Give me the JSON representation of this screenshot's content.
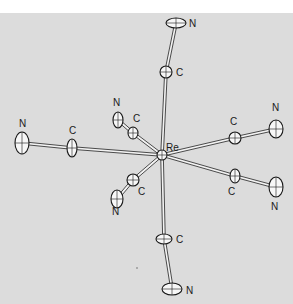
{
  "figure": {
    "background_color": "#dcdcdc",
    "top_band_color": "#ffffff",
    "center": {
      "label": "Re",
      "x": 162,
      "y": 155,
      "label_x": 166,
      "label_y": 151
    },
    "ligands": [
      {
        "name": "top",
        "c": {
          "x": 166,
          "y": 72,
          "rx": 6,
          "ry": 6,
          "label_x": 176,
          "label_y": 76
        },
        "n": {
          "x": 176,
          "y": 23,
          "rx": 10,
          "ry": 5,
          "label_x": 189,
          "label_y": 27
        }
      },
      {
        "name": "upper-left",
        "c": {
          "x": 133,
          "y": 133,
          "rx": 5,
          "ry": 6,
          "label_x": 133,
          "label_y": 122
        },
        "n": {
          "x": 118,
          "y": 120,
          "rx": 5,
          "ry": 8,
          "label_x": 113,
          "label_y": 106
        }
      },
      {
        "name": "left",
        "c": {
          "x": 72,
          "y": 148,
          "rx": 5,
          "ry": 9,
          "label_x": 69,
          "label_y": 134
        },
        "n": {
          "x": 22,
          "y": 143,
          "rx": 7,
          "ry": 11,
          "label_x": 19,
          "label_y": 127
        }
      },
      {
        "name": "right-upper",
        "c": {
          "x": 235,
          "y": 138,
          "rx": 6,
          "ry": 6,
          "label_x": 230,
          "label_y": 125
        },
        "n": {
          "x": 276,
          "y": 129,
          "rx": 7,
          "ry": 9,
          "label_x": 272,
          "label_y": 111
        }
      },
      {
        "name": "right-lower",
        "c": {
          "x": 235,
          "y": 176,
          "rx": 5,
          "ry": 7,
          "label_x": 228,
          "label_y": 195
        },
        "n": {
          "x": 276,
          "y": 187,
          "rx": 7,
          "ry": 10,
          "label_x": 271,
          "label_y": 210
        }
      },
      {
        "name": "lower-left",
        "c": {
          "x": 133,
          "y": 180,
          "rx": 6,
          "ry": 6,
          "label_x": 138,
          "label_y": 195
        },
        "n": {
          "x": 117,
          "y": 199,
          "rx": 6,
          "ry": 9,
          "label_x": 112,
          "label_y": 215
        }
      },
      {
        "name": "bottom",
        "c": {
          "x": 164,
          "y": 239,
          "rx": 8,
          "ry": 5,
          "label_x": 176,
          "label_y": 243
        },
        "n": {
          "x": 172,
          "y": 289,
          "rx": 10,
          "ry": 6,
          "label_x": 186,
          "label_y": 294
        }
      }
    ],
    "atom_labels": {
      "carbon": "C",
      "nitrogen": "N",
      "metal": "Re"
    }
  }
}
